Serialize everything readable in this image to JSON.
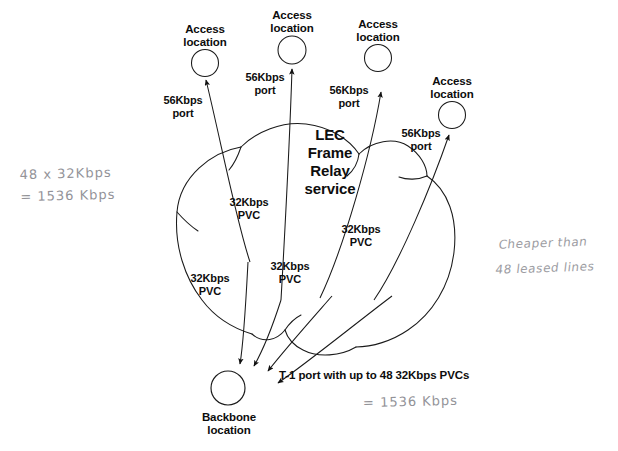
{
  "diagram": {
    "title": "LEC Frame Relay service",
    "cloud_label": "LEC\nFrame\nRelay\nservice",
    "colors": {
      "ink": "#111111",
      "pencil": "#8f8f96",
      "background": "#ffffff"
    },
    "access_locations": [
      {
        "label": "Access\nlocation",
        "port_label": "56Kbps\nport"
      },
      {
        "label": "Access\nlocation",
        "port_label": "56Kbps\nport"
      },
      {
        "label": "Access\nlocation",
        "port_label": "56Kbps\nport"
      },
      {
        "label": "Access\nlocation",
        "port_label": "56Kbps\nport"
      }
    ],
    "pvc_labels": [
      "32Kbps\nPVC",
      "32Kbps\nPVC",
      "32Kbps\nPVC",
      "32Kbps\nPVC"
    ],
    "backbone": {
      "label": "Backbone\nlocation",
      "trunk_label": "T-1 port with up to 48 32Kbps PVCs"
    },
    "annotations": [
      {
        "name": "bandwidth-calculation",
        "text": "48 x 32Kbps\n= 1536 Kbps"
      },
      {
        "name": "cost-note",
        "text": "Cheaper than\n48 leased lines"
      },
      {
        "name": "trunk-total",
        "text": "= 1536 Kbps"
      }
    ]
  }
}
